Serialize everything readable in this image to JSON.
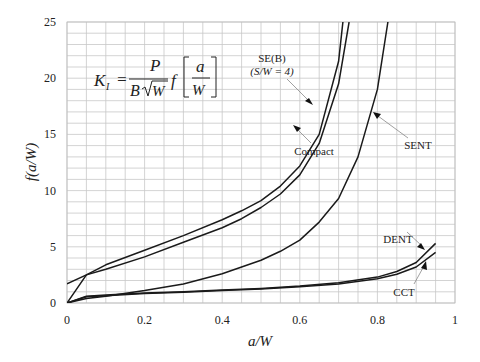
{
  "chart_data": {
    "type": "line",
    "title": "",
    "xlabel": "a/W",
    "ylabel": "f(a/W)",
    "xlim": [
      0,
      1
    ],
    "ylim": [
      0,
      25
    ],
    "xticks": [
      "0",
      "0.2",
      "0.4",
      "0.6",
      "0.8",
      "1"
    ],
    "yticks": [
      "0",
      "5",
      "10",
      "15",
      "20",
      "25"
    ],
    "grid": {
      "x_step": 0.05,
      "y_step": 1,
      "on": true
    },
    "equation": "K_I = P / (B sqrt(W)) f[a/W]",
    "series": [
      {
        "name": "SE(B) (S/W = 4)",
        "x": [
          0,
          0.05,
          0.1,
          0.2,
          0.3,
          0.4,
          0.45,
          0.5,
          0.55,
          0.6,
          0.65,
          0.7,
          0.711
        ],
        "y": [
          1.7,
          2.5,
          3.4,
          4.7,
          6.0,
          7.4,
          8.2,
          9.1,
          10.4,
          12.2,
          15.0,
          21.5,
          25
        ]
      },
      {
        "name": "Compact",
        "x": [
          0,
          0.05,
          0.1,
          0.2,
          0.3,
          0.4,
          0.45,
          0.5,
          0.55,
          0.6,
          0.65,
          0.7,
          0.727
        ],
        "y": [
          0,
          2.5,
          3.0,
          4.1,
          5.4,
          6.7,
          7.5,
          8.5,
          9.7,
          11.4,
          14.2,
          19.5,
          25
        ]
      },
      {
        "name": "SENT",
        "x": [
          0,
          0.05,
          0.1,
          0.2,
          0.3,
          0.4,
          0.5,
          0.55,
          0.6,
          0.65,
          0.7,
          0.75,
          0.8,
          0.827
        ],
        "y": [
          0,
          0.4,
          0.6,
          1.1,
          1.7,
          2.6,
          3.8,
          4.6,
          5.6,
          7.2,
          9.3,
          13.0,
          19.0,
          25
        ]
      },
      {
        "name": "DENT",
        "x": [
          0,
          0.05,
          0.1,
          0.2,
          0.3,
          0.4,
          0.5,
          0.6,
          0.7,
          0.8,
          0.85,
          0.9,
          0.95
        ],
        "y": [
          0,
          0.6,
          0.7,
          0.9,
          1.0,
          1.15,
          1.3,
          1.5,
          1.8,
          2.3,
          2.8,
          3.6,
          5.3
        ]
      },
      {
        "name": "CCT",
        "x": [
          0,
          0.05,
          0.1,
          0.2,
          0.3,
          0.4,
          0.5,
          0.6,
          0.7,
          0.8,
          0.85,
          0.9,
          0.95
        ],
        "y": [
          0,
          0.55,
          0.65,
          0.85,
          0.95,
          1.1,
          1.25,
          1.45,
          1.7,
          2.15,
          2.55,
          3.2,
          4.5
        ]
      }
    ],
    "annotations": [
      {
        "text": "SE(B)",
        "subtext": "(S/W = 4)",
        "target": "SE(B)"
      },
      {
        "text": "Compact",
        "target": "Compact"
      },
      {
        "text": "SENT",
        "target": "SENT"
      },
      {
        "text": "DENT",
        "target": "DENT"
      },
      {
        "text": "CCT",
        "target": "CCT"
      }
    ]
  },
  "labels": {
    "xlabel": "a/W",
    "ylabel": "f(a/W)",
    "seb": "SE(B)",
    "seb_sub": "(S/W = 4)",
    "compact": "Compact",
    "sent": "SENT",
    "dent": "DENT",
    "cct": "CCT",
    "eq_k": "K",
    "eq_ksub": "I",
    "eq_eq": "=",
    "eq_p": "P",
    "eq_b": "B",
    "eq_w": "W",
    "eq_f": "f",
    "eq_a": "a",
    "eq_w2": "W"
  },
  "ticks": {
    "x": [
      "0",
      "0.2",
      "0.4",
      "0.6",
      "0.8",
      "1"
    ],
    "y": [
      "0",
      "5",
      "10",
      "15",
      "20",
      "25"
    ]
  }
}
